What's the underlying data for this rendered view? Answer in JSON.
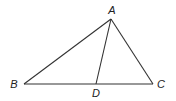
{
  "diagram": {
    "type": "geometry-triangle",
    "stroke_color": "#333333",
    "points": {
      "A": {
        "label": "A",
        "x": 111,
        "y": 19,
        "lx": 112,
        "ly": 14
      },
      "B": {
        "label": "B",
        "x": 24,
        "y": 84,
        "lx": 14,
        "ly": 88
      },
      "C": {
        "label": "C",
        "x": 153,
        "y": 84,
        "lx": 161,
        "ly": 88
      },
      "D": {
        "label": "D",
        "x": 96,
        "y": 84,
        "lx": 96,
        "ly": 97
      }
    },
    "segments": [
      "AB",
      "AC",
      "BC",
      "AD"
    ]
  }
}
